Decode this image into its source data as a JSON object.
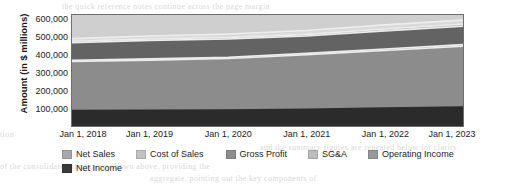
{
  "background_bleed": {
    "line1": "the quick reference notes continue across the page margin",
    "line2": "tion",
    "line3": "and the summary figures are repeated below for clarity",
    "line4": "of the consolidated statements shown above, providing the",
    "line5": "aggregate, pointing out the key components of"
  },
  "chart_data": {
    "type": "area",
    "title": "",
    "xlabel": "",
    "ylabel": "Amount  (in $ millions)",
    "categories": [
      "Jan 1, 2018",
      "Jan 1, 2019",
      "Jan 1, 2020",
      "Jan 1, 2021",
      "Jan 1, 2022",
      "Jan 1, 2023"
    ],
    "x_tick_labels": [
      "Jan 1, 2018",
      "Jan 1, 2019",
      "Jan 1, 2020",
      "Jan 1, 2021",
      "Jan 1, 2022",
      "Jan 1, 2023"
    ],
    "y_tick_labels": [
      "100,000",
      "200,000",
      "300,000",
      "400,000",
      "500,000",
      "600,000"
    ],
    "y_tick_values": [
      100000,
      200000,
      300000,
      400000,
      500000,
      600000
    ],
    "ylim": [
      0,
      630000
    ],
    "grid": false,
    "legend_position": "bottom",
    "series": [
      {
        "name": "Net Sales",
        "color": "#d9d9d9",
        "values": [
          496000,
          511000,
          522000,
          542000,
          574000,
          601000
        ]
      },
      {
        "name": "Cost of Sales",
        "color": "#a6a6a6",
        "values": [
          481000,
          494000,
          502000,
          520000,
          551000,
          578000
        ]
      },
      {
        "name": "Gross Profit",
        "color": "#636363",
        "values": [
          473000,
          486000,
          494000,
          511000,
          540000,
          566000
        ]
      },
      {
        "name": "SG&A",
        "color": "#9a9a9a",
        "values": [
          373000,
          381000,
          390000,
          412000,
          437000,
          462000
        ]
      },
      {
        "name": "Operating Income",
        "color": "#8c8c8c",
        "values": [
          366000,
          374000,
          383000,
          404000,
          429000,
          453000
        ]
      },
      {
        "name": "Net Income",
        "color": "#2b2b2b",
        "values": [
          92000,
          94000,
          95000,
          99000,
          106000,
          112000
        ]
      }
    ]
  },
  "legend": {
    "row1": [
      {
        "label": "Net Sales",
        "color": "#a8a8a8"
      },
      {
        "label": "Cost of Sales",
        "color": "#c2c2c2"
      },
      {
        "label": "Gross Profit",
        "color": "#8e8e8e"
      },
      {
        "label": "SG&A",
        "color": "#bcbcbc"
      },
      {
        "label": "Operating Income",
        "color": "#989898"
      }
    ],
    "row2": [
      {
        "label": "Net Income",
        "color": "#3a3a3a"
      }
    ]
  }
}
